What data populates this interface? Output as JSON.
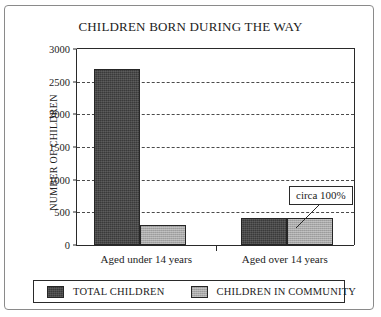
{
  "chart_data": {
    "type": "bar",
    "title": "CHILDREN BORN DURING THE WAY",
    "xlabel": "",
    "ylabel": "NUMBER OF CHILDREN",
    "categories": [
      "Aged under 14 years",
      "Aged over 14 years"
    ],
    "series": [
      {
        "name": "TOTAL CHILDREN",
        "color": "#3a3a3a",
        "values": [
          2700,
          420
        ]
      },
      {
        "name": "CHILDREN IN COMMUNITY",
        "color": "#a8a8a8",
        "values": [
          300,
          420
        ]
      }
    ],
    "ylim": [
      0,
      3000
    ],
    "ytick_step": 500,
    "yticks": [
      0,
      500,
      1000,
      1500,
      2000,
      2500,
      3000
    ],
    "ytick_labels": [
      "0",
      "500",
      "1000",
      "1500",
      "2000",
      "2500",
      "3000"
    ],
    "grid": true,
    "grid_style": "dashed-horizontal",
    "legend_position": "bottom",
    "annotations": [
      {
        "text": "circa 100%",
        "target_series": "CHILDREN IN COMMUNITY",
        "target_category": "Aged over 14 years"
      }
    ]
  }
}
